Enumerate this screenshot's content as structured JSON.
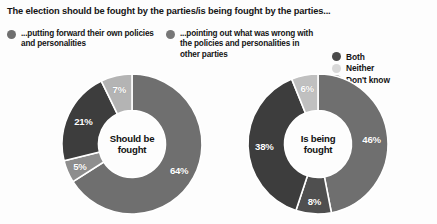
{
  "title": "The election should be fought by the parties/is being fought by the parties...",
  "legend": {
    "items": [
      {
        "name": "own-policies",
        "text": "...putting forward their own policies and personalities",
        "color": "#6f6f6f"
      },
      {
        "name": "attack-others",
        "text": "...pointing out what was wrong with the policies and personalities in other parties",
        "color": "#777777"
      }
    ],
    "mini_items": [
      {
        "name": "both",
        "label": "Both",
        "color": "#4a4a4a"
      },
      {
        "name": "neither",
        "label": "Neither",
        "color": "#d8d8d8"
      },
      {
        "name": "dont-know",
        "label": "Don't know",
        "color": "#a8a8a8"
      }
    ]
  },
  "chart_data": [
    {
      "type": "pie",
      "name": "should-be-fought",
      "title": "Should be fought",
      "center_label_lines": [
        "Should be",
        "fought"
      ],
      "categories": [
        "...putting forward their own policies and personalities",
        "Both",
        "...pointing out what was wrong with the policies and personalities in other parties",
        "Don't know"
      ],
      "values": [
        64,
        5,
        21,
        7
      ],
      "labels": [
        "64%",
        "5%",
        "21%",
        "7%"
      ],
      "colors": [
        "#6f6f6f",
        "#8e8e8e",
        "#3d3d3d",
        "#b4b4b4"
      ],
      "donut": true,
      "legend_position": "top"
    },
    {
      "type": "pie",
      "name": "is-being-fought",
      "title": "Is being fought",
      "center_label_lines": [
        "Is being",
        "fought"
      ],
      "categories": [
        "...putting forward their own policies and personalities",
        "Both",
        "...pointing out what was wrong with the policies and personalities in other parties",
        "Don't know"
      ],
      "values": [
        46,
        8,
        38,
        6
      ],
      "labels": [
        "46%",
        "8%",
        "38%",
        "6%"
      ],
      "colors": [
        "#6f6f6f",
        "#4f4f4f",
        "#3d3d3d",
        "#c0c0c0"
      ],
      "donut": true,
      "legend_position": "top"
    }
  ]
}
